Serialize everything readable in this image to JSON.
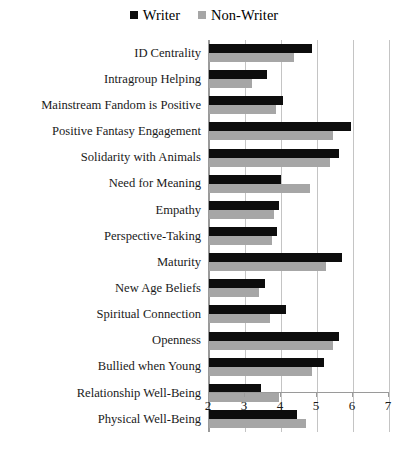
{
  "chart_data": {
    "type": "bar",
    "orientation": "horizontal",
    "title": "",
    "subtitle": "",
    "xlabel": "",
    "ylabel": "",
    "xlim": [
      2,
      7
    ],
    "xticks": [
      2,
      3,
      4,
      5,
      6,
      7
    ],
    "xtick_labels": [
      "2",
      "3",
      "4",
      "5",
      "6",
      "7"
    ],
    "grid": true,
    "grid_axis": "x",
    "legend_position": "top-center",
    "categories": [
      "ID Centrality",
      "Intragroup Helping",
      "Mainstream Fandom is Positive",
      "Positive Fantasy Engagement",
      "Solidarity with Animals",
      "Need for Meaning",
      "Empathy",
      "Perspective-Taking",
      "Maturity",
      "New Age Beliefs",
      "Spiritual Connection",
      "Openness",
      "Bullied when Young",
      "Relationship Well-Being",
      "Physical Well-Being"
    ],
    "series": [
      {
        "name": "Writer",
        "color": "#0d0d0d",
        "values": [
          4.85,
          3.6,
          4.05,
          5.95,
          5.6,
          4.0,
          3.95,
          3.9,
          5.7,
          3.55,
          4.15,
          5.6,
          5.2,
          3.45,
          4.45
        ]
      },
      {
        "name": "Non-Writer",
        "color": "#a6a6a6",
        "values": [
          4.35,
          3.2,
          3.85,
          5.45,
          5.35,
          4.8,
          3.8,
          3.75,
          5.25,
          3.4,
          3.7,
          5.45,
          4.85,
          3.95,
          4.7
        ]
      }
    ]
  },
  "legend": {
    "items": [
      {
        "label": "Writer",
        "color": "#0d0d0d"
      },
      {
        "label": "Non-Writer",
        "color": "#a6a6a6"
      }
    ]
  }
}
